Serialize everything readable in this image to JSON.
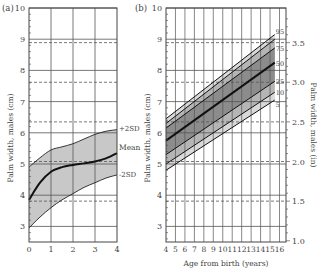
{
  "chart_data": [
    {
      "panel": "(a)",
      "type": "area",
      "title": "",
      "xlabel": "",
      "ylabel": "Palm width, males (cm)",
      "xlim": [
        0,
        4
      ],
      "ylim": [
        2.5,
        10
      ],
      "x_ticks": [
        "0",
        "1",
        "2",
        "3",
        "4"
      ],
      "y_ticks": [
        "3",
        "4",
        "5",
        "6",
        "7",
        "8",
        "9",
        "10"
      ],
      "grid": true,
      "dashed_reference_lines_cm": [
        3.81,
        5.08,
        6.35,
        7.62,
        8.89
      ],
      "series": [
        {
          "name": "+2SD",
          "x": [
            0,
            0.5,
            1,
            1.5,
            2,
            2.5,
            3,
            3.5,
            4
          ],
          "values": [
            4.9,
            5.2,
            5.45,
            5.55,
            5.65,
            5.8,
            5.95,
            6.05,
            6.1
          ]
        },
        {
          "name": "Mean",
          "x": [
            0,
            0.5,
            1,
            1.5,
            2,
            2.5,
            3,
            3.5,
            4
          ],
          "values": [
            3.85,
            4.4,
            4.75,
            4.9,
            4.97,
            5.02,
            5.08,
            5.18,
            5.35
          ]
        },
        {
          "name": "-2SD",
          "x": [
            0,
            0.5,
            1,
            1.5,
            2,
            2.5,
            3,
            3.5,
            4
          ],
          "values": [
            2.95,
            3.3,
            3.6,
            3.85,
            4.05,
            4.25,
            4.4,
            4.55,
            4.65
          ]
        }
      ],
      "annotations": [
        "+2SD",
        "Mean",
        "-2SD"
      ]
    },
    {
      "panel": "(b)",
      "type": "line",
      "title": "",
      "xlabel": "Age from birth (years)",
      "ylabel": "Palm width, males (cm)",
      "ylabel_right": "Palm width, males (in)",
      "xlim": [
        4,
        16.7
      ],
      "ylim": [
        2.5,
        10
      ],
      "ylim_right": [
        1.0,
        3.94
      ],
      "x_ticks": [
        "4",
        "5",
        "6",
        "7",
        "8",
        "9",
        "10",
        "11",
        "12",
        "13",
        "14",
        "15",
        "16"
      ],
      "y_ticks": [
        "3",
        "4",
        "5",
        "6",
        "7",
        "8",
        "9",
        "10"
      ],
      "y_ticks_right": [
        "1.0",
        "1.5",
        "2.0",
        "2.5",
        "3.0",
        "3.5"
      ],
      "grid": true,
      "series": [
        {
          "name": "95",
          "x": [
            4,
            15.5
          ],
          "values": [
            6.45,
            9.15
          ]
        },
        {
          "name": "90",
          "x": [
            4,
            15.5
          ],
          "values": [
            6.3,
            9.0
          ]
        },
        {
          "name": "75",
          "x": [
            4,
            15.5
          ],
          "values": [
            6.15,
            8.72
          ]
        },
        {
          "name": "50",
          "x": [
            4,
            15.5
          ],
          "values": [
            5.75,
            8.25
          ]
        },
        {
          "name": "25",
          "x": [
            4,
            15.5
          ],
          "values": [
            5.3,
            7.65
          ]
        },
        {
          "name": "10",
          "x": [
            4,
            15.5
          ],
          "values": [
            5.0,
            7.3
          ]
        },
        {
          "name": "5",
          "x": [
            4,
            15.5
          ],
          "values": [
            4.8,
            7.05
          ]
        }
      ],
      "legend": [
        "95",
        "75",
        "50",
        "25",
        "10",
        "5"
      ]
    }
  ],
  "panel_a": {
    "label": "(a)",
    "ylabel": "Palm width, males (cm)",
    "x_ticks": [
      "0",
      "1",
      "2",
      "3",
      "4"
    ],
    "y_ticks": [
      "3",
      "4",
      "5",
      "6",
      "7",
      "8",
      "9",
      "10"
    ],
    "labels": {
      "plus2sd": "+2SD",
      "mean": "Mean",
      "minus2sd": "-2SD"
    }
  },
  "panel_b": {
    "label": "(b)",
    "ylabel": "Palm width, males (cm)",
    "ylabel_right": "Palm width, males (in)",
    "xlabel": "Age from birth (years)",
    "x_ticks": [
      "4",
      "5",
      "6",
      "7",
      "8",
      "9",
      "10",
      "11",
      "12",
      "13",
      "14",
      "15",
      "16"
    ],
    "y_ticks": [
      "3",
      "4",
      "5",
      "6",
      "7",
      "8",
      "9",
      "10"
    ],
    "y_ticks_right": [
      "1.0",
      "1.5",
      "2.0",
      "2.5",
      "3.0",
      "3.5"
    ],
    "percentiles": [
      "95",
      "75",
      "50",
      "25",
      "10",
      "5"
    ]
  },
  "colors": {
    "frame": "#444444",
    "grid": "#555555",
    "band_outer": "#d9d9d9",
    "band_mid": "#b5b5b5",
    "band_inner": "#8c8c8c",
    "sd_band": "#c8c8c8",
    "mean_line": "#111111"
  }
}
